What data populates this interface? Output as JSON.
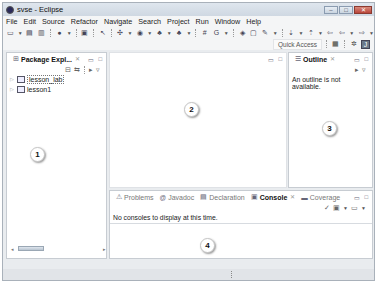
{
  "window": {
    "title": "svse - Eclipse",
    "controls": [
      "minimize",
      "maximize",
      "close"
    ]
  },
  "menubar": {
    "items": [
      "File",
      "Edit",
      "Source",
      "Refactor",
      "Navigate",
      "Search",
      "Project",
      "Run",
      "Window",
      "Help"
    ]
  },
  "toolbar": {
    "icons": [
      "new-icon",
      "save-icon",
      "save-all-icon",
      "debug-icon",
      "terminal-icon",
      "cursor-icon",
      "plus-icon",
      "run-icon",
      "new-java-icon",
      "new-class-icon",
      "grid-icon",
      "coverage-icon",
      "open-type-icon",
      "open-task-icon",
      "pin-icon",
      "next-annotation-icon",
      "prev-annotation-icon",
      "back-icon",
      "forward-icon"
    ],
    "quick_access": "Quick Access"
  },
  "package_explorer": {
    "tab_label": "Package Expl...",
    "projects": [
      {
        "name": "lesson_lab",
        "selected": true
      },
      {
        "name": "lesson1",
        "selected": false
      }
    ]
  },
  "outline": {
    "tab_label": "Outline",
    "message": "An outline is not available."
  },
  "bottom_panel": {
    "tabs": [
      {
        "label": "Problems",
        "active": false
      },
      {
        "label": "Javadoc",
        "active": false
      },
      {
        "label": "Declaration",
        "active": false
      },
      {
        "label": "Console",
        "active": true
      },
      {
        "label": "Coverage",
        "active": false
      }
    ],
    "message": "No consoles to display at this time."
  },
  "markers": [
    "1",
    "2",
    "3",
    "4"
  ]
}
